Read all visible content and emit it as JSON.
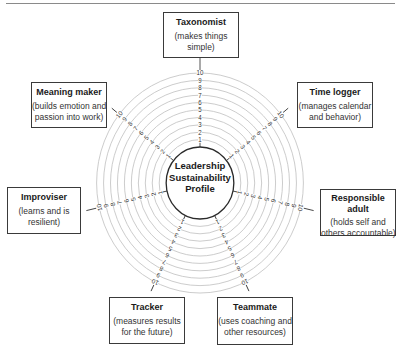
{
  "diagram": {
    "center_label": [
      "Leadership",
      "Sustainability",
      "Profile"
    ],
    "scale": {
      "min": 1,
      "max": 10,
      "ticks": [
        "1",
        "2",
        "3",
        "4",
        "5",
        "6",
        "7",
        "8",
        "9",
        "10"
      ]
    },
    "colors": {
      "ring": "#bdbdbd",
      "spoke": "#3a3a3a",
      "border": "#3a3a3a",
      "text": "#1a1a1a"
    },
    "roles": [
      {
        "title": "Taxonomist",
        "description": [
          "(makes things",
          "simple)"
        ]
      },
      {
        "title": "Time logger",
        "description": [
          "(manages calendar",
          "and behavior)"
        ]
      },
      {
        "title": "Responsible adult",
        "title_lines": [
          "Responsible",
          "adult"
        ],
        "description": [
          "(holds self and",
          "others accountable)"
        ]
      },
      {
        "title": "Teammate",
        "description": [
          "(uses coaching and",
          "other resources)"
        ]
      },
      {
        "title": "Tracker",
        "description": [
          "(measures results",
          "for the future)"
        ]
      },
      {
        "title": "Improviser",
        "description": [
          "(learns and is",
          "resilient)"
        ]
      },
      {
        "title": "Meaning maker",
        "description": [
          "(builds emotion and",
          "passion into work)"
        ]
      }
    ]
  }
}
